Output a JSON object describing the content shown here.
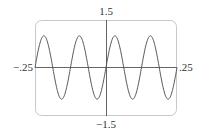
{
  "chart_data": {
    "type": "line",
    "title": "",
    "xlabel": "",
    "ylabel": "",
    "function": "y = sin(16*pi*x)",
    "xlim": [
      -0.25,
      0.25
    ],
    "ylim": [
      -1.5,
      1.5
    ],
    "grid": false,
    "legend": null,
    "tick_labels": {
      "x_left": "−.25",
      "x_right": ".25",
      "y_top": "1.5",
      "y_bottom": "−1.5"
    },
    "series": [
      {
        "name": "sine wave",
        "amplitude": 1.0,
        "period": 0.125,
        "cycles": 4,
        "x": [
          -0.25,
          -0.21875,
          -0.1875,
          -0.15625,
          -0.125,
          -0.09375,
          -0.0625,
          -0.03125,
          0,
          0.03125,
          0.0625,
          0.09375,
          0.125,
          0.15625,
          0.1875,
          0.21875,
          0.25
        ],
        "y": [
          0,
          0,
          0,
          0,
          0,
          0,
          0,
          0,
          0,
          0,
          0,
          0,
          0,
          0,
          0,
          0,
          0
        ],
        "peaks_x": [
          -0.21875,
          -0.09375,
          0.03125,
          0.15625
        ],
        "troughs_x": [
          -0.15625,
          -0.03125,
          0.09375,
          0.21875
        ]
      }
    ],
    "colors": {
      "curve": "#555555",
      "axes": "#666666",
      "frame": "#c8c8c8"
    }
  }
}
